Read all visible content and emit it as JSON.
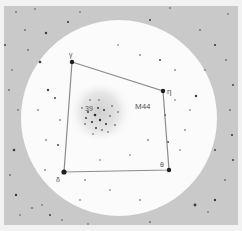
{
  "chart": {
    "background_color": "#f2f2f2",
    "frame_color": "#c8c8c8",
    "field_of_view_color": "#fbfbfb",
    "line_color": "#8a8a8a",
    "star_color": "#333333"
  },
  "labels": {
    "cluster_name": "M44",
    "cluster_star": "39",
    "star_top_left": "γ",
    "star_top_right": "η",
    "star_bottom_right": "θ",
    "star_bottom_left": "δ"
  },
  "asterism": {
    "vertices": [
      {
        "name": "gamma",
        "x": 72,
        "y": 62
      },
      {
        "name": "eta",
        "x": 163,
        "y": 91
      },
      {
        "name": "theta",
        "x": 169,
        "y": 170
      },
      {
        "name": "delta",
        "x": 64,
        "y": 172
      }
    ]
  }
}
